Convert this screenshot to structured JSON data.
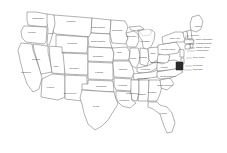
{
  "map": {
    "title": "United States of America",
    "background_color": "#ffffff",
    "border_color": "#555555",
    "fill_color": "#ffffff",
    "highlight_color": "#2b2b2b",
    "label_color": "#3a3a3a",
    "projection": "albers-usa",
    "highlighted_states": [
      "Maryland"
    ],
    "states": [
      {
        "name": "Washington",
        "label": "Washington",
        "lx": 38,
        "ly": 19,
        "outside": false
      },
      {
        "name": "Oregon",
        "label": "Oregon",
        "lx": 32,
        "ly": 33,
        "outside": false
      },
      {
        "name": "California",
        "label": "California",
        "lx": 26,
        "ly": 73,
        "outside": false
      },
      {
        "name": "Nevada",
        "label": "Nevada",
        "lx": 36,
        "ly": 60,
        "outside": false
      },
      {
        "name": "Idaho",
        "label": "Idaho",
        "lx": 51,
        "ly": 34,
        "outside": false
      },
      {
        "name": "Montana",
        "label": "Montana",
        "lx": 71,
        "ly": 22,
        "outside": false
      },
      {
        "name": "Wyoming",
        "label": "Wyoming",
        "lx": 72,
        "ly": 44,
        "outside": false
      },
      {
        "name": "Utah",
        "label": "Utah",
        "lx": 56,
        "ly": 67,
        "outside": false
      },
      {
        "name": "Arizona",
        "label": "Arizona",
        "lx": 50,
        "ly": 88,
        "outside": false
      },
      {
        "name": "Colorado",
        "label": "Colorado",
        "lx": 74,
        "ly": 69,
        "outside": false
      },
      {
        "name": "New Mexico",
        "label": "New Mexico",
        "lx": 70,
        "ly": 94,
        "outside": false
      },
      {
        "name": "North Dakota",
        "label": "North Dakota",
        "lx": 98,
        "ly": 28,
        "outside": false
      },
      {
        "name": "South Dakota",
        "label": "South Dakota",
        "lx": 98,
        "ly": 42,
        "outside": false
      },
      {
        "name": "Nebraska",
        "label": "Nebraska",
        "lx": 98,
        "ly": 57,
        "outside": false
      },
      {
        "name": "Kansas",
        "label": "Kansas",
        "lx": 99,
        "ly": 73,
        "outside": false
      },
      {
        "name": "Oklahoma",
        "label": "Oklahoma",
        "lx": 101,
        "ly": 87,
        "outside": false
      },
      {
        "name": "Texas",
        "label": "Texas",
        "lx": 96,
        "ly": 107,
        "outside": false
      },
      {
        "name": "Minnesota",
        "label": "Minnesota",
        "lx": 117,
        "ly": 31,
        "outside": false
      },
      {
        "name": "Iowa",
        "label": "Iowa",
        "lx": 119,
        "ly": 53,
        "outside": false
      },
      {
        "name": "Missouri",
        "label": "Missouri",
        "lx": 123,
        "ly": 70,
        "outside": false
      },
      {
        "name": "Arkansas",
        "label": "Arkansas",
        "lx": 122,
        "ly": 86,
        "outside": false
      },
      {
        "name": "Louisiana",
        "label": "Louisiana",
        "lx": 124,
        "ly": 101,
        "outside": false
      },
      {
        "name": "Wisconsin",
        "label": "Wisconsin",
        "lx": 131,
        "ly": 37,
        "outside": false
      },
      {
        "name": "Illinois",
        "label": "Illinois",
        "lx": 133,
        "ly": 59,
        "outside": false
      },
      {
        "name": "Michigan",
        "label": "Michigan",
        "lx": 145,
        "ly": 42,
        "outside": false
      },
      {
        "name": "Indiana",
        "label": "Indiana",
        "lx": 143,
        "ly": 58,
        "outside": false
      },
      {
        "name": "Ohio",
        "label": "Ohio",
        "lx": 153,
        "ly": 54,
        "outside": false
      },
      {
        "name": "Kentucky",
        "label": "Kentucky",
        "lx": 146,
        "ly": 70,
        "outside": false
      },
      {
        "name": "Tennessee",
        "label": "Tennessee",
        "lx": 143,
        "ly": 79,
        "outside": false
      },
      {
        "name": "Mississippi",
        "label": "Mississippi",
        "lx": 132,
        "ly": 94,
        "outside": false
      },
      {
        "name": "Alabama",
        "label": "Alabama",
        "lx": 141,
        "ly": 95,
        "outside": false
      },
      {
        "name": "Georgia",
        "label": "Georgia",
        "lx": 152,
        "ly": 93,
        "outside": false
      },
      {
        "name": "Florida",
        "label": "Florida",
        "lx": 163,
        "ly": 114,
        "outside": false
      },
      {
        "name": "South Carolina",
        "label": "South Carolina",
        "lx": 165,
        "ly": 86,
        "outside": false
      },
      {
        "name": "North Carolina",
        "label": "North Carolina",
        "lx": 168,
        "ly": 77,
        "outside": false
      },
      {
        "name": "Virginia",
        "label": "Virginia",
        "lx": 164,
        "ly": 68,
        "outside": false
      },
      {
        "name": "West Virginia",
        "label": "West Virginia",
        "lx": 157,
        "ly": 63,
        "outside": false
      },
      {
        "name": "Pennsylvania",
        "label": "Pennsylvania",
        "lx": 168,
        "ly": 50,
        "outside": false
      },
      {
        "name": "New York",
        "label": "New York",
        "lx": 175,
        "ly": 39,
        "outside": false
      },
      {
        "name": "Maine",
        "label": "Maine",
        "lx": 198,
        "ly": 27,
        "outside": false
      },
      {
        "name": "Vermont",
        "label": "Vermont",
        "lx": 190,
        "ly": 36,
        "outside": true,
        "leader": [
          185,
          36,
          189,
          36
        ]
      },
      {
        "name": "New Hampshire",
        "label": "New Hampshire",
        "lx": 196,
        "ly": 40,
        "outside": true,
        "leader": [
          189,
          40,
          195,
          40
        ]
      },
      {
        "name": "Massachusetts",
        "label": "Massachusetts",
        "lx": 196,
        "ly": 44,
        "outside": true,
        "leader": [
          188,
          44,
          195,
          44
        ]
      },
      {
        "name": "Rhode Island",
        "label": "Rhode Island",
        "lx": 196,
        "ly": 48,
        "outside": true,
        "leader": [
          189,
          48,
          195,
          48
        ]
      },
      {
        "name": "Connecticut",
        "label": "Connecticut",
        "lx": 196,
        "ly": 51,
        "outside": true,
        "leader": [
          187,
          51,
          195,
          51
        ]
      },
      {
        "name": "New Jersey",
        "label": "New Jersey",
        "lx": 193,
        "ly": 58,
        "outside": true,
        "leader": [
          186,
          58,
          192,
          58
        ]
      },
      {
        "name": "Delaware",
        "label": "Delaware",
        "lx": 193,
        "ly": 66,
        "outside": true,
        "leader": [
          185,
          66,
          192,
          66
        ]
      },
      {
        "name": "Maryland",
        "label": "Maryland",
        "lx": 193,
        "ly": 70,
        "outside": true,
        "leader": [
          183,
          70,
          192,
          70
        ]
      }
    ]
  }
}
